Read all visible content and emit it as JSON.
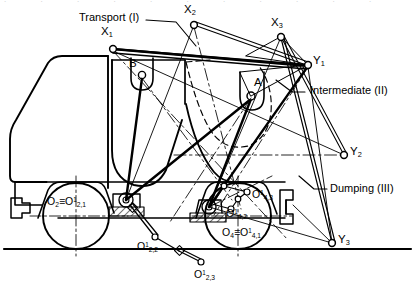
{
  "figure": {
    "kind": "kinematic-linkage-diagram",
    "background": "#ffffff",
    "ink": "#000000"
  },
  "legend": [
    {
      "id": "transport",
      "label": "Transport (I)",
      "x": 79,
      "y": 12,
      "leader": [
        [
          146,
          20
        ],
        [
          176,
          22
        ],
        [
          196,
          46
        ]
      ]
    },
    {
      "id": "intermediate",
      "label": "Intermediate (II)",
      "x": 310,
      "y": 88,
      "leader": [
        [
          305,
          92
        ],
        [
          292,
          92
        ],
        [
          276,
          80
        ]
      ]
    },
    {
      "id": "dumping",
      "label": "Dumping (III)",
      "x": 330,
      "y": 185,
      "leader": [
        [
          327,
          189
        ],
        [
          315,
          189
        ],
        [
          300,
          176
        ]
      ]
    }
  ],
  "points": [
    {
      "id": "X1",
      "base": "X",
      "sub": "1",
      "sup": "",
      "cx": 113,
      "cy": 49,
      "lx": 101,
      "ly": 28
    },
    {
      "id": "X2",
      "base": "X",
      "sub": "2",
      "sup": "",
      "cx": 194,
      "cy": 25,
      "lx": 184,
      "ly": 6
    },
    {
      "id": "X3",
      "base": "X",
      "sub": "3",
      "sup": "",
      "cx": 281,
      "cy": 37,
      "lx": 271,
      "ly": 19
    },
    {
      "id": "Y1",
      "base": "Y",
      "sub": "1",
      "sup": "",
      "cx": 308,
      "cy": 65,
      "lx": 313,
      "ly": 56
    },
    {
      "id": "Y2",
      "base": "Y",
      "sub": "2",
      "sup": "",
      "cx": 344,
      "cy": 155,
      "lx": 350,
      "ly": 147
    },
    {
      "id": "Y3",
      "base": "Y",
      "sub": "3",
      "sup": "",
      "cx": 332,
      "cy": 243,
      "lx": 338,
      "ly": 235
    },
    {
      "id": "A",
      "base": "A",
      "sub": "",
      "sup": "",
      "cx": 251,
      "cy": 96,
      "lx": 254,
      "ly": 78
    },
    {
      "id": "B",
      "base": "B",
      "sub": "",
      "sup": "",
      "cx": 142,
      "cy": 75,
      "lx": 129,
      "ly": 60
    }
  ],
  "pivots": [
    {
      "id": "O2_identity",
      "text": "O₂≡O¹₂,₁",
      "base": "O",
      "sub": "2",
      "eq": "≡",
      "base2": "O",
      "sup2": "1",
      "sub2": "2,1",
      "x": 47,
      "y": 197
    },
    {
      "id": "O2_2",
      "text": "O¹₂,₂",
      "base": "O",
      "sup": "1",
      "sub": "2,2",
      "x": 137,
      "y": 242
    },
    {
      "id": "O2_3",
      "text": "O¹₂,₃",
      "base": "O",
      "sup": "1",
      "sub": "2,3",
      "x": 194,
      "y": 270
    },
    {
      "id": "O4_identity",
      "text": "O₄≡O¹₄,₁",
      "base": "O",
      "sub": "4",
      "eq": "≡",
      "base2": "O",
      "sup2": "1",
      "sub2": "4,1",
      "x": 222,
      "y": 228
    },
    {
      "id": "O4_2",
      "text": "O¹₄,₂",
      "base": "O",
      "sup": "1",
      "sub": "4,2",
      "x": 226,
      "y": 209
    },
    {
      "id": "O4_3",
      "text": "O¹₄,₃",
      "base": "O",
      "sup": "1",
      "sub": "4,3",
      "x": 252,
      "y": 190
    }
  ],
  "joint_markers": [
    {
      "id": "jm-o2-2",
      "cx": 155,
      "cy": 237
    },
    {
      "id": "jm-o2-3",
      "cx": 201,
      "cy": 262
    },
    {
      "id": "jm-o4-2",
      "cx": 231,
      "cy": 209
    },
    {
      "id": "jm-o4-3",
      "cx": 247,
      "cy": 192
    },
    {
      "id": "jm-o4-3b",
      "cx": 238,
      "cy": 199
    }
  ],
  "top_scan_noise": ". . . . . . . . . . . . . . . . . . . . . ."
}
